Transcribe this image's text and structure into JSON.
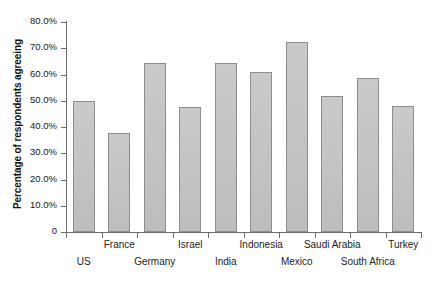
{
  "chart": {
    "type": "bar",
    "background_color": "#ffffff",
    "bar_color": "#c4c4c4",
    "bar_border_color": "#8d8d8d",
    "axis_color": "#6e6e6e",
    "ylabel": "Percentage of respondents agreeing",
    "xlabel": "",
    "title": ""
  },
  "chart_data": {
    "type": "bar",
    "title": "",
    "xlabel": "",
    "ylabel": "Percentage of respondents agreeing",
    "ylim": [
      0,
      80
    ],
    "grid": false,
    "legend": null,
    "ytick_labels": [
      "80.0%",
      "70.0%",
      "60.0%",
      "50.0%",
      "40.0%",
      "30.0%",
      "20.0%",
      "10.0%",
      "0"
    ],
    "ytick_values": [
      80,
      70,
      60,
      50,
      40,
      30,
      20,
      10,
      0
    ],
    "categories": [
      "US",
      "France",
      "Germany",
      "Israel",
      "India",
      "Indonesia",
      "Mexico",
      "Saudi Arabia",
      "South Africa",
      "Turkey"
    ],
    "values": [
      50.0,
      37.8,
      64.5,
      47.5,
      64.2,
      61.0,
      72.3,
      52.0,
      58.5,
      48.0
    ],
    "series": [
      {
        "name": "Percentage of respondents agreeing",
        "values": [
          50.0,
          37.8,
          64.5,
          47.5,
          64.2,
          61.0,
          72.3,
          52.0,
          58.5,
          48.0
        ]
      }
    ]
  }
}
